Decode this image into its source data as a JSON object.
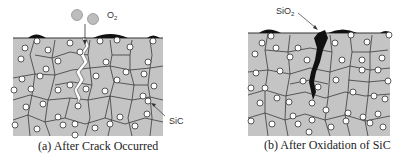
{
  "panels": [
    {
      "id": "a",
      "caption": "(a) After Crack Occurred",
      "labels": {
        "gas": "O",
        "gas_sub": "2",
        "particle": "SiC"
      }
    },
    {
      "id": "b",
      "caption": "(b) After Oxidation of SiC",
      "labels": {
        "oxide": "SiO",
        "oxide_sub": "2"
      }
    }
  ],
  "colors": {
    "matrix": "#c4c4c4",
    "grain_line": "#3a3a3a",
    "particle_fill": "#ffffff",
    "oxide": "#111111",
    "o2_bubble": "#bdbdbd"
  }
}
